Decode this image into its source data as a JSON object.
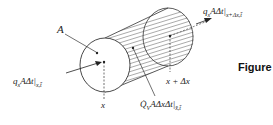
{
  "diagram": {
    "labels": {
      "area": "A",
      "inflow": "q",
      "inflow_sub_x": "x",
      "inflow_rest": "AΔt|",
      "inflow_eval": "x,t̄",
      "outflow": "q",
      "outflow_sub_x": "x",
      "outflow_rest": "AΔt|",
      "outflow_eval": "x+Δx,t̄",
      "x_pos": "x",
      "x_plus": "x + Δx",
      "generation_Q": "Q̇",
      "generation_sub": "V",
      "generation_rest": "AΔxΔt|",
      "generation_eval": "x̄,t̄"
    },
    "caption": "Figure"
  }
}
